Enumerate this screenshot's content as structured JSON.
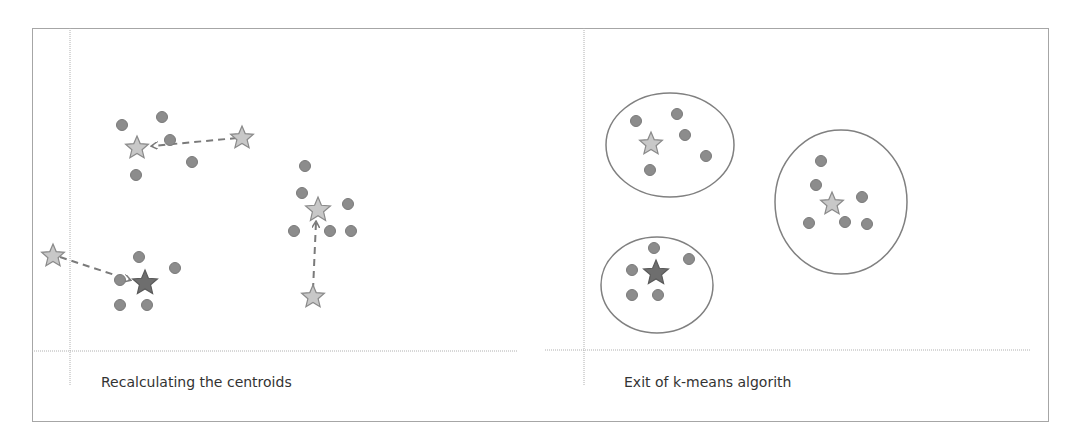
{
  "colors": {
    "frame_border": "#a6a6a6",
    "axis_line": "#b0b0b0",
    "dot_fill": "#8c8c8c",
    "dot_stroke": "#7a7a7a",
    "star_light_fill": "#c8c8c8",
    "star_light_stroke": "#8a8a8a",
    "star_dark_fill": "#6e6e6e",
    "star_dark_stroke": "#5a5a5a",
    "arrow": "#7a7a7a",
    "ellipse": "#808080",
    "text": "#333333"
  },
  "panels": [
    {
      "id": "recalculating",
      "caption": "Recalculating the centroids",
      "caption_pos": [
        101,
        383
      ],
      "axes": {
        "vline": {
          "x": 70,
          "y1": 28,
          "y2": 385
        },
        "hline": {
          "y": 351,
          "x1": 32,
          "x2": 517
        }
      },
      "points": [
        [
          122,
          125
        ],
        [
          162,
          117
        ],
        [
          170,
          140
        ],
        [
          192,
          162
        ],
        [
          136,
          175
        ],
        [
          139,
          257
        ],
        [
          175,
          268
        ],
        [
          120,
          280
        ],
        [
          120,
          305
        ],
        [
          147,
          305
        ],
        [
          305,
          166
        ],
        [
          302,
          193
        ],
        [
          348,
          204
        ],
        [
          294,
          231
        ],
        [
          330,
          231
        ],
        [
          351,
          231
        ]
      ],
      "centroids": [
        {
          "name": "cluster-1-new",
          "x": 137,
          "y": 148,
          "size": 12,
          "style": "light"
        },
        {
          "name": "cluster-1-old",
          "x": 242,
          "y": 138,
          "size": 12,
          "style": "light"
        },
        {
          "name": "cluster-2-new",
          "x": 145,
          "y": 283,
          "size": 13,
          "style": "dark"
        },
        {
          "name": "cluster-2-old",
          "x": 53,
          "y": 256,
          "size": 12,
          "style": "light"
        },
        {
          "name": "cluster-3-new",
          "x": 318,
          "y": 210,
          "size": 13,
          "style": "light"
        },
        {
          "name": "cluster-3-old",
          "x": 313,
          "y": 297,
          "size": 12,
          "style": "light"
        }
      ],
      "arrows": [
        {
          "from": [
            237,
            138
          ],
          "to": [
            152,
            146
          ]
        },
        {
          "from": [
            60,
            257
          ],
          "to": [
            130,
            280
          ]
        },
        {
          "from": [
            313,
            290
          ],
          "to": [
            316,
            222
          ]
        }
      ]
    },
    {
      "id": "exit",
      "caption": "Exit of k-means algorith",
      "caption_pos": [
        624,
        383
      ],
      "axes": {
        "vline": {
          "x": 584,
          "y1": 28,
          "y2": 385
        },
        "hline": {
          "y": 350,
          "x1": 545,
          "x2": 1030
        }
      },
      "ellipses": [
        {
          "cx": 670,
          "cy": 145,
          "rx": 64,
          "ry": 52
        },
        {
          "cx": 841,
          "cy": 202,
          "rx": 66,
          "ry": 72
        },
        {
          "cx": 657,
          "cy": 285,
          "rx": 56,
          "ry": 48
        }
      ],
      "points": [
        [
          636,
          121
        ],
        [
          677,
          114
        ],
        [
          685,
          135
        ],
        [
          706,
          156
        ],
        [
          650,
          170
        ],
        [
          821,
          161
        ],
        [
          816,
          185
        ],
        [
          862,
          197
        ],
        [
          809,
          223
        ],
        [
          845,
          222
        ],
        [
          867,
          224
        ],
        [
          654,
          248
        ],
        [
          689,
          259
        ],
        [
          632,
          270
        ],
        [
          632,
          295
        ],
        [
          658,
          295
        ]
      ],
      "centroids": [
        {
          "name": "cluster-1-final",
          "x": 651,
          "y": 144,
          "size": 12,
          "style": "light"
        },
        {
          "name": "cluster-2-final",
          "x": 832,
          "y": 204,
          "size": 12,
          "style": "light"
        },
        {
          "name": "cluster-3-final",
          "x": 656,
          "y": 273,
          "size": 13,
          "style": "dark"
        }
      ]
    }
  ]
}
